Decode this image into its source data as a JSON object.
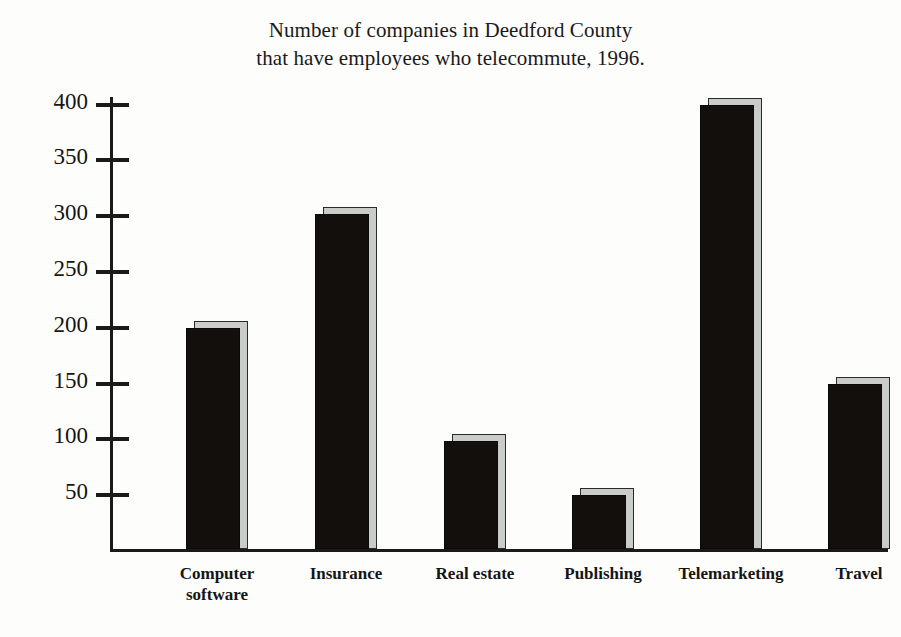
{
  "chart_data": {
    "type": "bar",
    "title": "Number of companies in Deedford County that have employees who telecommute, 1996.",
    "title_lines": [
      "Number of companies in Deedford County",
      "that have employees who telecommute, 1996."
    ],
    "categories": [
      "Computer software",
      "Insurance",
      "Real estate",
      "Publishing",
      "Telemarketing",
      "Travel"
    ],
    "category_lines": [
      [
        "Computer",
        "software"
      ],
      [
        "Insurance"
      ],
      [
        "Real estate"
      ],
      [
        "Publishing"
      ],
      [
        "Telemarketing"
      ],
      [
        "Travel"
      ]
    ],
    "values": [
      198,
      300,
      97,
      48,
      398,
      148
    ],
    "xlabel": "",
    "ylabel": "",
    "ylim": [
      0,
      405
    ],
    "yticks": [
      50,
      100,
      150,
      200,
      250,
      300,
      350,
      400
    ],
    "ytick_labels": [
      "50",
      "100",
      "150",
      "200",
      "250",
      "300",
      "350",
      "400"
    ],
    "grid": false,
    "legend": false,
    "colors": {
      "bar_face": "#120f0d",
      "bar_shadow": "#c9ccc9",
      "axis": "#1a1a1a",
      "text": "#151515",
      "background": "#fdfdfc"
    }
  }
}
